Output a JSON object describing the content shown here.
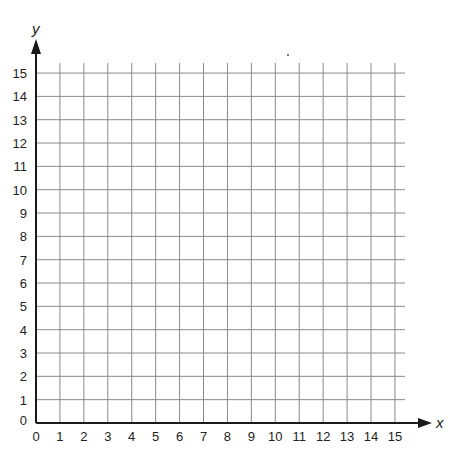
{
  "diagram": {
    "type": "coordinate-grid",
    "x_axis": {
      "label": "x",
      "min": 0,
      "max": 15,
      "step": 1
    },
    "y_axis": {
      "label": "y",
      "min": 0,
      "max": 15,
      "step": 1
    },
    "x_ticks": [
      "0",
      "1",
      "2",
      "3",
      "4",
      "5",
      "6",
      "7",
      "8",
      "9",
      "10",
      "11",
      "12",
      "13",
      "14",
      "15"
    ],
    "y_ticks": [
      "0",
      "1",
      "2",
      "3",
      "4",
      "5",
      "6",
      "7",
      "8",
      "9",
      "10",
      "11",
      "12",
      "13",
      "14",
      "15"
    ],
    "colors": {
      "grid": "#8a8a8a",
      "axis": "#1a1a1a",
      "text": "#222222",
      "background": "#ffffff"
    }
  }
}
